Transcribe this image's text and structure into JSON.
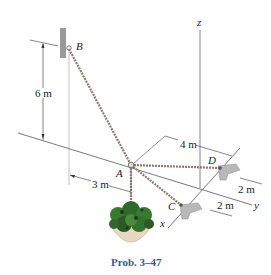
{
  "figure": {
    "caption": "Prob. 3–47",
    "points": {
      "A": "A",
      "B": "B",
      "C": "C",
      "D": "D"
    },
    "axes": {
      "x": "x",
      "y": "y",
      "z": "z"
    },
    "dimensions": {
      "height_B": "6 m",
      "offset_A_x": "3 m",
      "offset_A_y": "4 m",
      "spacing_D": "2 m",
      "spacing_C": "2 m"
    },
    "colors": {
      "caption": "#3a5a88",
      "cable": "#8a7a6a",
      "wall": "#9a9a9a",
      "bracket": "#b8b8b8",
      "plant": "#2f6a2a",
      "pot": "#e8d8c0"
    }
  }
}
